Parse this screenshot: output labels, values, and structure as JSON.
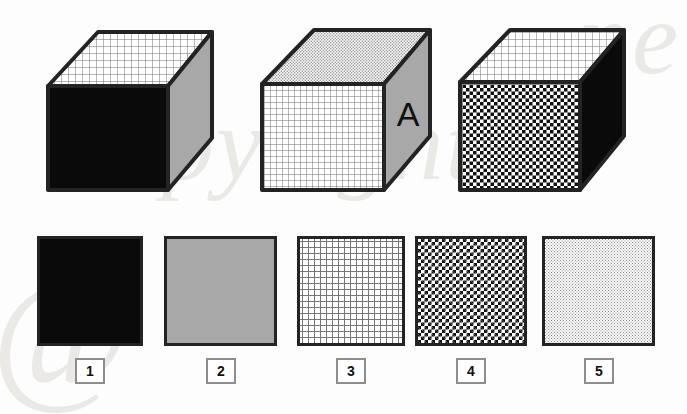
{
  "page": {
    "kind": "spatial-reasoning-puzzle",
    "background_color": "#fdfdfd",
    "watermark": {
      "at_symbol": "@",
      "word": "opyright",
      "tail": "ne",
      "color": "#ebe9e6"
    }
  },
  "palette": {
    "black": "#0a0a0a",
    "gray": "#a8a8a8",
    "outline": "#232323",
    "label_border": "#8d8d8d",
    "white": "#ffffff",
    "grid_line": "#777777",
    "dot": "#8a8a8a"
  },
  "patterns": {
    "solid_black": {
      "name": "solid-black",
      "swatch_ref": 1
    },
    "solid_gray": {
      "name": "solid-gray",
      "swatch_ref": 2
    },
    "grid": {
      "name": "fine-grid",
      "swatch_ref": 3,
      "cell_px": 6
    },
    "checker": {
      "name": "checkerboard",
      "swatch_ref": 4,
      "cell_px": 3.5
    },
    "dots": {
      "name": "fine-dots",
      "swatch_ref": 5,
      "cell_px": 3
    }
  },
  "cubes": [
    {
      "id": "cube-1",
      "index": 1,
      "top_face": "grid",
      "front_face": "solid_black",
      "right_face": "solid_gray",
      "letter": ""
    },
    {
      "id": "cube-2",
      "index": 2,
      "top_face": "dots",
      "front_face": "grid",
      "right_face": "solid_gray",
      "letter": "A"
    },
    {
      "id": "cube-3",
      "index": 3,
      "top_face": "grid",
      "front_face": "checker",
      "right_face": "solid_black",
      "letter": ""
    }
  ],
  "options": [
    {
      "number": "1",
      "pattern": "solid_black",
      "pattern_label": "solid black"
    },
    {
      "number": "2",
      "pattern": "solid_gray",
      "pattern_label": "solid gray"
    },
    {
      "number": "3",
      "pattern": "grid",
      "pattern_label": "fine grid"
    },
    {
      "number": "4",
      "pattern": "checker",
      "pattern_label": "checkerboard"
    },
    {
      "number": "5",
      "pattern": "dots",
      "pattern_label": "fine dots"
    }
  ]
}
